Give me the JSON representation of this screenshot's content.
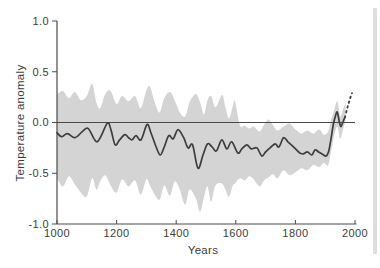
{
  "figure": {
    "background_color": "#ffffff",
    "scan_edge_color": "#d8d8d8"
  },
  "chart_data": {
    "type": "line",
    "title": "",
    "xlabel": "Years",
    "ylabel": "Temperature anomaly",
    "xlim": [
      1000,
      2000
    ],
    "ylim": [
      -1.0,
      1.0
    ],
    "grid": false,
    "legend": "none",
    "zero_line_value": 0.0,
    "x_ticks": [
      {
        "label": "1000",
        "value": 1000
      },
      {
        "label": "1200",
        "value": 1200
      },
      {
        "label": "1400",
        "value": 1400
      },
      {
        "label": "1600",
        "value": 1600
      },
      {
        "label": "1800",
        "value": 1800
      },
      {
        "label": "2000",
        "value": 2000
      }
    ],
    "y_ticks": [
      {
        "label": "1.0",
        "value": 1.0
      },
      {
        "label": "0.5",
        "value": 0.5
      },
      {
        "label": "0.0",
        "value": 0.0
      },
      {
        "label": "-0.5",
        "value": -0.5
      },
      {
        "label": "-1.0",
        "value": -1.0
      }
    ],
    "colors": {
      "band": "#d4d4d4",
      "line": "#3d3d3d",
      "dashed_line": "#3d3d3d",
      "axis": "#4a4a4a",
      "zero_line": "#4a4a4a",
      "text": "#3c3c3c"
    },
    "series": [
      {
        "name": "reconstructed-temperature-smoothed",
        "type": "line",
        "style": "solid",
        "x": [
          1000,
          1015,
          1035,
          1060,
          1085,
          1105,
          1135,
          1168,
          1180,
          1195,
          1210,
          1228,
          1240,
          1252,
          1265,
          1282,
          1302,
          1315,
          1330,
          1346,
          1360,
          1375,
          1390,
          1406,
          1425,
          1440,
          1455,
          1473,
          1490,
          1505,
          1520,
          1535,
          1553,
          1570,
          1586,
          1607,
          1620,
          1637,
          1652,
          1671,
          1687,
          1700,
          1715,
          1732,
          1745,
          1760,
          1775,
          1790,
          1804,
          1815,
          1826,
          1840,
          1855,
          1866,
          1878,
          1890,
          1903,
          1912,
          1920,
          1928,
          1936,
          1941,
          1948,
          1953,
          1960,
          1966
        ],
        "y": [
          -0.1,
          -0.14,
          -0.11,
          -0.15,
          -0.09,
          -0.06,
          -0.19,
          -0.01,
          -0.06,
          -0.22,
          -0.17,
          -0.12,
          -0.15,
          -0.17,
          -0.13,
          -0.17,
          -0.02,
          -0.1,
          -0.22,
          -0.32,
          -0.24,
          -0.13,
          -0.16,
          -0.07,
          -0.15,
          -0.25,
          -0.22,
          -0.45,
          -0.32,
          -0.21,
          -0.24,
          -0.28,
          -0.17,
          -0.26,
          -0.19,
          -0.3,
          -0.26,
          -0.22,
          -0.26,
          -0.25,
          -0.33,
          -0.29,
          -0.25,
          -0.21,
          -0.24,
          -0.15,
          -0.19,
          -0.23,
          -0.27,
          -0.3,
          -0.31,
          -0.29,
          -0.32,
          -0.27,
          -0.29,
          -0.31,
          -0.33,
          -0.28,
          -0.15,
          -0.01,
          0.08,
          0.1,
          0.0,
          -0.04,
          0.01,
          0.05
        ]
      },
      {
        "name": "instrumental-record-projection",
        "type": "line",
        "style": "dashed",
        "x": [
          1966,
          1972,
          1978,
          1984,
          1990
        ],
        "y": [
          0.05,
          0.12,
          0.18,
          0.24,
          0.29
        ]
      },
      {
        "name": "uncertainty-band",
        "type": "band",
        "x": [
          1000,
          1020,
          1040,
          1060,
          1080,
          1100,
          1118,
          1132,
          1145,
          1162,
          1180,
          1200,
          1218,
          1240,
          1262,
          1281,
          1300,
          1312,
          1330,
          1345,
          1360,
          1379,
          1395,
          1412,
          1430,
          1445,
          1466,
          1480,
          1493,
          1505,
          1517,
          1532,
          1554,
          1565,
          1577,
          1590,
          1597,
          1614,
          1630,
          1645,
          1660,
          1680,
          1695,
          1710,
          1725,
          1740,
          1760,
          1780,
          1800,
          1820,
          1840,
          1860,
          1880,
          1895,
          1910,
          1920,
          1930,
          1941,
          1950,
          1960,
          1968
        ],
        "upper": [
          0.28,
          0.31,
          0.24,
          0.3,
          0.22,
          0.26,
          0.38,
          0.2,
          0.14,
          0.28,
          0.31,
          0.18,
          0.26,
          0.21,
          0.26,
          0.14,
          0.32,
          0.35,
          0.18,
          0.1,
          0.24,
          0.3,
          0.22,
          0.1,
          0.06,
          0.2,
          0.28,
          0.2,
          0.08,
          0.22,
          0.26,
          0.15,
          0.27,
          0.15,
          0.04,
          0.16,
          0.21,
          -0.03,
          -0.03,
          -0.06,
          -0.04,
          -0.09,
          -0.02,
          0.03,
          -0.03,
          -0.08,
          -0.04,
          -0.01,
          -0.07,
          -0.11,
          -0.08,
          -0.11,
          -0.07,
          -0.12,
          -0.09,
          0.03,
          0.12,
          0.21,
          0.06,
          0.13,
          0.2
        ],
        "lower": [
          -0.55,
          -0.63,
          -0.53,
          -0.61,
          -0.69,
          -0.73,
          -0.55,
          -0.66,
          -0.58,
          -0.52,
          -0.62,
          -0.69,
          -0.56,
          -0.63,
          -0.57,
          -0.71,
          -0.56,
          -0.62,
          -0.72,
          -0.76,
          -0.62,
          -0.72,
          -0.58,
          -0.66,
          -0.81,
          -0.66,
          -0.75,
          -0.88,
          -0.74,
          -0.63,
          -0.78,
          -0.62,
          -0.6,
          -0.66,
          -0.73,
          -0.62,
          -0.6,
          -0.55,
          -0.57,
          -0.53,
          -0.56,
          -0.63,
          -0.57,
          -0.54,
          -0.51,
          -0.55,
          -0.47,
          -0.52,
          -0.49,
          -0.45,
          -0.47,
          -0.42,
          -0.44,
          -0.4,
          -0.42,
          -0.28,
          -0.13,
          -0.04,
          -0.16,
          -0.07,
          0.02
        ]
      }
    ]
  }
}
